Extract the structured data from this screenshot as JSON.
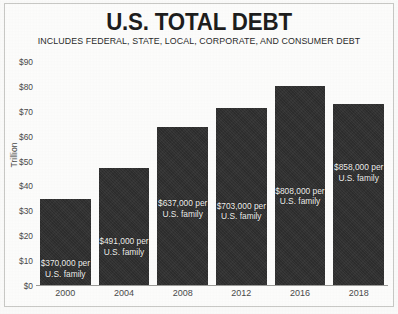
{
  "chart": {
    "title": "U.S. TOTAL DEBT",
    "subtitle": "INCLUDES FEDERAL, STATE, LOCAL, CORPORATE, AND CONSUMER DEBT",
    "y_axis_label": "Trillion",
    "y_ticks": [
      "$90",
      "$80",
      "$70",
      "$60",
      "$50",
      "$40",
      "$30",
      "$20",
      "$10",
      "$0"
    ],
    "bar_color": "#2f2f2f",
    "bar_label_color": "#f2f2f0",
    "background_color": "#fdfdfc",
    "frame_color": "#c9c9c6"
  },
  "chart_data": {
    "type": "bar",
    "title": "U.S. TOTAL DEBT",
    "subtitle": "INCLUDES FEDERAL, STATE, LOCAL, CORPORATE, AND CONSUMER DEBT",
    "xlabel": "",
    "ylabel": "Trillion",
    "ylim": [
      0,
      90
    ],
    "ytick_values": [
      0,
      10,
      20,
      30,
      40,
      50,
      60,
      70,
      80,
      90
    ],
    "ytick_labels": [
      "$0",
      "$10",
      "$20",
      "$30",
      "$40",
      "$50",
      "$60",
      "$70",
      "$80",
      "$90"
    ],
    "grid": false,
    "legend": "none",
    "categories": [
      "2000",
      "2004",
      "2008",
      "2012",
      "2016",
      "2018"
    ],
    "values": [
      35,
      47.5,
      64,
      71.5,
      80.5,
      73
    ],
    "data_labels": [
      "$370,000 per\nU.S. family",
      "$491,000 per\nU.S. family",
      "$637,000 per\nU.S. family",
      "$703,000 per\nU.S. family",
      "$808,000 per\nU.S. family",
      "$858,000 per\nU.S. family"
    ],
    "bars": [
      {
        "year": "2000",
        "value": 35,
        "label": "$370,000 per\nU.S. family",
        "label_offset_pct": 68
      },
      {
        "year": "2004",
        "value": 47.5,
        "label": "$491,000 per\nU.S. family",
        "label_offset_pct": 58
      },
      {
        "year": "2008",
        "value": 64,
        "label": "$637,000 per\nU.S. family",
        "label_offset_pct": 45
      },
      {
        "year": "2012",
        "value": 71.5,
        "label": "$703,000 per\nU.S. family",
        "label_offset_pct": 52
      },
      {
        "year": "2016",
        "value": 80.5,
        "label": "$808,000 per\nU.S. family",
        "label_offset_pct": 50
      },
      {
        "year": "2018",
        "value": 73,
        "label": "$858,000 per\nU.S. family",
        "label_offset_pct": 32
      }
    ]
  }
}
